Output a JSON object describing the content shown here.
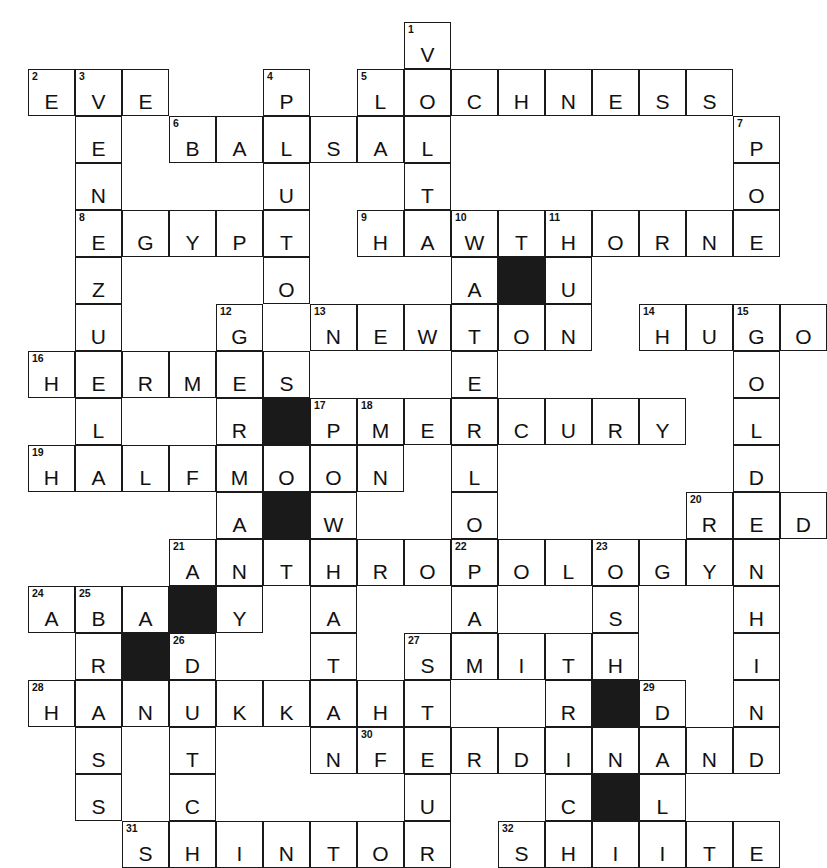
{
  "puzzle": {
    "title": "Crossword Puzzle Grid",
    "columns": 17,
    "rows": 16,
    "cell_size": 47,
    "colors": {
      "grid_line": "#1a1a1a",
      "block_fill": "#1a1a1a",
      "cell_fill": "#ffffff",
      "text": "#111111",
      "page_background": "#ffffff"
    }
  },
  "answers": {
    "across": [
      {
        "number": 2,
        "text": "EVE",
        "row": 1,
        "col": 0
      },
      {
        "number": 5,
        "text": "LOCHNESS",
        "row": 1,
        "col": 7
      },
      {
        "number": 6,
        "text": "BALSA",
        "row": 2,
        "col": 3
      },
      {
        "number": 8,
        "text": "EGYPT",
        "row": 4,
        "col": 1
      },
      {
        "number": 9,
        "text": "HAWTHORNE",
        "row": 4,
        "col": 7
      },
      {
        "number": 13,
        "text": "NEWTON",
        "row": 6,
        "col": 6
      },
      {
        "number": 14,
        "text": "HUGO",
        "row": 6,
        "col": 13
      },
      {
        "number": 16,
        "text": "HERMES",
        "row": 7,
        "col": 0
      },
      {
        "number": 18,
        "text": "MERCURY",
        "row": 8,
        "col": 7
      },
      {
        "number": 19,
        "text": "HALFMOON",
        "row": 9,
        "col": 0
      },
      {
        "number": 20,
        "text": "RED",
        "row": 10,
        "col": 14
      },
      {
        "number": 21,
        "text": "ANTHROPOLOGY",
        "row": 11,
        "col": 3
      },
      {
        "number": 24,
        "text": "ABA",
        "row": 12,
        "col": 0
      },
      {
        "number": 27,
        "text": "SMITH",
        "row": 13,
        "col": 8
      },
      {
        "number": 28,
        "text": "HANUKKAH",
        "row": 14,
        "col": 0
      },
      {
        "number": 30,
        "text": "FERDINAND",
        "row": 15,
        "col": 7
      },
      {
        "number": 31,
        "text": "SHINTO",
        "row": 17,
        "col": 2
      },
      {
        "number": 32,
        "text": "SHIITE",
        "row": 17,
        "col": 10
      }
    ],
    "down": [
      {
        "number": 1,
        "text": "VOLTA",
        "row": 0,
        "col": 8
      },
      {
        "number": 3,
        "text": "EVENZULH",
        "row": 1,
        "col": 1
      },
      {
        "number": 4,
        "text": "PLUTO",
        "row": 1,
        "col": 5
      },
      {
        "number": 7,
        "text": "POE",
        "row": 2,
        "col": 15
      },
      {
        "number": 10,
        "text": "WATERLOO",
        "row": 4,
        "col": 9
      },
      {
        "number": 11,
        "text": "TU",
        "row": 4,
        "col": 11
      },
      {
        "number": 12,
        "text": "GERMANY",
        "row": 6,
        "col": 6
      },
      {
        "number": 15,
        "text": "GOLDEN",
        "row": 6,
        "col": 15
      },
      {
        "number": 17,
        "text": "POW",
        "row": 8,
        "col": 7
      },
      {
        "number": 22,
        "text": "PASTEUR",
        "row": 11,
        "col": 10
      },
      {
        "number": 23,
        "text": "OSH",
        "row": 11,
        "col": 13
      },
      {
        "number": 25,
        "text": "BRASS",
        "row": 12,
        "col": 1
      },
      {
        "number": 26,
        "text": "DNTC",
        "row": 13,
        "col": 3
      },
      {
        "number": 29,
        "text": "DNL",
        "row": 14,
        "col": 13
      }
    ]
  },
  "cells": [
    {
      "r": 0,
      "c": 8,
      "n": "1",
      "l": "V"
    },
    {
      "r": 1,
      "c": 0,
      "n": "2",
      "l": "E"
    },
    {
      "r": 1,
      "c": 1,
      "n": "3",
      "l": "V"
    },
    {
      "r": 1,
      "c": 2,
      "n": "",
      "l": "E"
    },
    {
      "r": 1,
      "c": 5,
      "n": "4",
      "l": "P"
    },
    {
      "r": 1,
      "c": 7,
      "n": "5",
      "l": "L"
    },
    {
      "r": 1,
      "c": 8,
      "n": "",
      "l": "O"
    },
    {
      "r": 1,
      "c": 9,
      "n": "",
      "l": "C"
    },
    {
      "r": 1,
      "c": 10,
      "n": "",
      "l": "H"
    },
    {
      "r": 1,
      "c": 11,
      "n": "",
      "l": "N"
    },
    {
      "r": 1,
      "c": 12,
      "n": "",
      "l": "E"
    },
    {
      "r": 1,
      "c": 13,
      "n": "",
      "l": "S"
    },
    {
      "r": 1,
      "c": 14,
      "n": "",
      "l": "S"
    },
    {
      "r": 2,
      "c": 1,
      "n": "",
      "l": "E"
    },
    {
      "r": 2,
      "c": 3,
      "n": "6",
      "l": "B"
    },
    {
      "r": 2,
      "c": 4,
      "n": "",
      "l": "A"
    },
    {
      "r": 2,
      "c": 5,
      "n": "",
      "l": "L"
    },
    {
      "r": 2,
      "c": 6,
      "n": "",
      "l": "S"
    },
    {
      "r": 2,
      "c": 7,
      "n": "",
      "l": "A"
    },
    {
      "r": 2,
      "c": 8,
      "n": "",
      "l": "L"
    },
    {
      "r": 2,
      "c": 15,
      "n": "7",
      "l": "P"
    },
    {
      "r": 3,
      "c": 1,
      "n": "",
      "l": "N"
    },
    {
      "r": 3,
      "c": 5,
      "n": "",
      "l": "U"
    },
    {
      "r": 3,
      "c": 8,
      "n": "",
      "l": "T"
    },
    {
      "r": 3,
      "c": 15,
      "n": "",
      "l": "O"
    },
    {
      "r": 4,
      "c": 1,
      "n": "8",
      "l": "E"
    },
    {
      "r": 4,
      "c": 2,
      "n": "",
      "l": "G"
    },
    {
      "r": 4,
      "c": 3,
      "n": "",
      "l": "Y"
    },
    {
      "r": 4,
      "c": 4,
      "n": "",
      "l": "P"
    },
    {
      "r": 4,
      "c": 5,
      "n": "",
      "l": "T"
    },
    {
      "r": 4,
      "c": 7,
      "n": "9",
      "l": "H"
    },
    {
      "r": 4,
      "c": 8,
      "n": "",
      "l": "A"
    },
    {
      "r": 4,
      "c": 9,
      "n": "10",
      "l": "W"
    },
    {
      "r": 4,
      "c": 10,
      "n": "",
      "l": "T"
    },
    {
      "r": 4,
      "c": 11,
      "n": "11",
      "l": "H"
    },
    {
      "r": 4,
      "c": 12,
      "n": "",
      "l": "O"
    },
    {
      "r": 4,
      "c": 13,
      "n": "",
      "l": "R"
    },
    {
      "r": 4,
      "c": 14,
      "n": "",
      "l": "N"
    },
    {
      "r": 4,
      "c": 15,
      "n": "",
      "l": "E"
    },
    {
      "r": 5,
      "c": 1,
      "n": "",
      "l": "Z"
    },
    {
      "r": 5,
      "c": 5,
      "n": "",
      "l": "O"
    },
    {
      "r": 5,
      "c": 9,
      "n": "",
      "l": "A"
    },
    {
      "r": 5,
      "c": 10,
      "n": "",
      "l": "",
      "block": true
    },
    {
      "r": 5,
      "c": 11,
      "n": "",
      "l": "U"
    },
    {
      "r": 6,
      "c": 1,
      "n": "",
      "l": "U"
    },
    {
      "r": 6,
      "c": 4,
      "n": "12",
      "l": "G"
    },
    {
      "r": 6,
      "c": 6,
      "n": "13",
      "l": "N"
    },
    {
      "r": 6,
      "c": 7,
      "n": "",
      "l": "E"
    },
    {
      "r": 6,
      "c": 8,
      "n": "",
      "l": "W"
    },
    {
      "r": 6,
      "c": 9,
      "n": "",
      "l": "T"
    },
    {
      "r": 6,
      "c": 10,
      "n": "",
      "l": "O"
    },
    {
      "r": 6,
      "c": 11,
      "n": "",
      "l": "N"
    },
    {
      "r": 6,
      "c": 13,
      "n": "14",
      "l": "H"
    },
    {
      "r": 6,
      "c": 14,
      "n": "",
      "l": "U"
    },
    {
      "r": 6,
      "c": 15,
      "n": "15",
      "l": "G"
    },
    {
      "r": 6,
      "c": 16,
      "n": "",
      "l": "O"
    },
    {
      "r": 7,
      "c": 0,
      "n": "16",
      "l": "H"
    },
    {
      "r": 7,
      "c": 1,
      "n": "",
      "l": "E"
    },
    {
      "r": 7,
      "c": 2,
      "n": "",
      "l": "R"
    },
    {
      "r": 7,
      "c": 3,
      "n": "",
      "l": "M"
    },
    {
      "r": 7,
      "c": 4,
      "n": "",
      "l": "E"
    },
    {
      "r": 7,
      "c": 5,
      "n": "",
      "l": "S"
    },
    {
      "r": 7,
      "c": 9,
      "n": "",
      "l": "E"
    },
    {
      "r": 7,
      "c": 15,
      "n": "",
      "l": "O"
    },
    {
      "r": 8,
      "c": 1,
      "n": "",
      "l": "L"
    },
    {
      "r": 8,
      "c": 4,
      "n": "",
      "l": "R"
    },
    {
      "r": 8,
      "c": 5,
      "n": "",
      "l": "",
      "block": true
    },
    {
      "r": 8,
      "c": 6,
      "n": "17",
      "l": "P"
    },
    {
      "r": 8,
      "c": 7,
      "n": "18",
      "l": "M"
    },
    {
      "r": 8,
      "c": 8,
      "n": "",
      "l": "E"
    },
    {
      "r": 8,
      "c": 9,
      "n": "",
      "l": "R"
    },
    {
      "r": 8,
      "c": 10,
      "n": "",
      "l": "C"
    },
    {
      "r": 8,
      "c": 11,
      "n": "",
      "l": "U"
    },
    {
      "r": 8,
      "c": 12,
      "n": "",
      "l": "R"
    },
    {
      "r": 8,
      "c": 13,
      "n": "",
      "l": "Y"
    },
    {
      "r": 8,
      "c": 15,
      "n": "",
      "l": "L"
    },
    {
      "r": 9,
      "c": 0,
      "n": "19",
      "l": "H"
    },
    {
      "r": 9,
      "c": 1,
      "n": "",
      "l": "A"
    },
    {
      "r": 9,
      "c": 2,
      "n": "",
      "l": "L"
    },
    {
      "r": 9,
      "c": 3,
      "n": "",
      "l": "F"
    },
    {
      "r": 9,
      "c": 4,
      "n": "",
      "l": "M"
    },
    {
      "r": 9,
      "c": 5,
      "n": "",
      "l": "O"
    },
    {
      "r": 9,
      "c": 6,
      "n": "",
      "l": "O"
    },
    {
      "r": 9,
      "c": 7,
      "n": "",
      "l": "N"
    },
    {
      "r": 9,
      "c": 9,
      "n": "",
      "l": "L"
    },
    {
      "r": 9,
      "c": 15,
      "n": "",
      "l": "D"
    },
    {
      "r": 10,
      "c": 4,
      "n": "",
      "l": "A"
    },
    {
      "r": 10,
      "c": 5,
      "n": "",
      "l": "",
      "block": true
    },
    {
      "r": 10,
      "c": 6,
      "n": "",
      "l": "W"
    },
    {
      "r": 10,
      "c": 9,
      "n": "",
      "l": "O"
    },
    {
      "r": 10,
      "c": 14,
      "n": "20",
      "l": "R"
    },
    {
      "r": 10,
      "c": 15,
      "n": "",
      "l": "E"
    },
    {
      "r": 10,
      "c": 16,
      "n": "",
      "l": "D"
    },
    {
      "r": 11,
      "c": 3,
      "n": "21",
      "l": "A"
    },
    {
      "r": 11,
      "c": 4,
      "n": "",
      "l": "N"
    },
    {
      "r": 11,
      "c": 5,
      "n": "",
      "l": "T"
    },
    {
      "r": 11,
      "c": 6,
      "n": "",
      "l": "H"
    },
    {
      "r": 11,
      "c": 7,
      "n": "",
      "l": "R"
    },
    {
      "r": 11,
      "c": 8,
      "n": "",
      "l": "O"
    },
    {
      "r": 11,
      "c": 9,
      "n": "22",
      "l": "P"
    },
    {
      "r": 11,
      "c": 10,
      "n": "",
      "l": "O"
    },
    {
      "r": 11,
      "c": 11,
      "n": "",
      "l": "L"
    },
    {
      "r": 11,
      "c": 12,
      "n": "23",
      "l": "O"
    },
    {
      "r": 11,
      "c": 13,
      "n": "",
      "l": "G"
    },
    {
      "r": 11,
      "c": 14,
      "n": "",
      "l": "Y"
    },
    {
      "r": 11,
      "c": 15,
      "n": "",
      "l": "N"
    },
    {
      "r": 12,
      "c": 0,
      "n": "24",
      "l": "A"
    },
    {
      "r": 12,
      "c": 1,
      "n": "25",
      "l": "B"
    },
    {
      "r": 12,
      "c": 2,
      "n": "",
      "l": "A"
    },
    {
      "r": 12,
      "c": 3,
      "n": "",
      "l": "",
      "block": true
    },
    {
      "r": 12,
      "c": 4,
      "n": "",
      "l": "Y"
    },
    {
      "r": 12,
      "c": 6,
      "n": "",
      "l": "A"
    },
    {
      "r": 12,
      "c": 9,
      "n": "",
      "l": "A"
    },
    {
      "r": 12,
      "c": 12,
      "n": "",
      "l": "S"
    },
    {
      "r": 12,
      "c": 15,
      "n": "",
      "l": "H"
    },
    {
      "r": 13,
      "c": 1,
      "n": "",
      "l": "R"
    },
    {
      "r": 13,
      "c": 2,
      "n": "",
      "l": "",
      "block": true
    },
    {
      "r": 13,
      "c": 3,
      "n": "26",
      "l": "D"
    },
    {
      "r": 13,
      "c": 6,
      "n": "",
      "l": "T"
    },
    {
      "r": 13,
      "c": 8,
      "n": "27",
      "l": "S"
    },
    {
      "r": 13,
      "c": 9,
      "n": "",
      "l": "M"
    },
    {
      "r": 13,
      "c": 10,
      "n": "",
      "l": "I"
    },
    {
      "r": 13,
      "c": 11,
      "n": "",
      "l": "T"
    },
    {
      "r": 13,
      "c": 12,
      "n": "",
      "l": "H"
    },
    {
      "r": 13,
      "c": 15,
      "n": "",
      "l": "I"
    },
    {
      "r": 14,
      "c": 0,
      "n": "28",
      "l": "H"
    },
    {
      "r": 14,
      "c": 1,
      "n": "",
      "l": "A"
    },
    {
      "r": 14,
      "c": 2,
      "n": "",
      "l": "N"
    },
    {
      "r": 14,
      "c": 3,
      "n": "",
      "l": "U"
    },
    {
      "r": 14,
      "c": 4,
      "n": "",
      "l": "K"
    },
    {
      "r": 14,
      "c": 5,
      "n": "",
      "l": "K"
    },
    {
      "r": 14,
      "c": 6,
      "n": "",
      "l": "A"
    },
    {
      "r": 14,
      "c": 7,
      "n": "",
      "l": "H"
    },
    {
      "r": 14,
      "c": 8,
      "n": "",
      "l": "T"
    },
    {
      "r": 14,
      "c": 11,
      "n": "",
      "l": "R"
    },
    {
      "r": 14,
      "c": 12,
      "n": "",
      "l": "",
      "block": true
    },
    {
      "r": 14,
      "c": 13,
      "n": "29",
      "l": "D"
    },
    {
      "r": 14,
      "c": 15,
      "n": "",
      "l": "N"
    },
    {
      "r": 15,
      "c": 1,
      "n": "",
      "l": "S"
    },
    {
      "r": 15,
      "c": 3,
      "n": "",
      "l": "T"
    },
    {
      "r": 15,
      "c": 6,
      "n": "",
      "l": "N"
    },
    {
      "r": 15,
      "c": 7,
      "n": "30",
      "l": "F"
    },
    {
      "r": 15,
      "c": 8,
      "n": "",
      "l": "E"
    },
    {
      "r": 15,
      "c": 9,
      "n": "",
      "l": "R"
    },
    {
      "r": 15,
      "c": 10,
      "n": "",
      "l": "D"
    },
    {
      "r": 15,
      "c": 11,
      "n": "",
      "l": "I"
    },
    {
      "r": 15,
      "c": 12,
      "n": "",
      "l": "N"
    },
    {
      "r": 15,
      "c": 13,
      "n": "",
      "l": "A"
    },
    {
      "r": 15,
      "c": 14,
      "n": "",
      "l": "N"
    },
    {
      "r": 15,
      "c": 15,
      "n": "",
      "l": "D"
    },
    {
      "r": 16,
      "c": 1,
      "n": "",
      "l": "S"
    },
    {
      "r": 16,
      "c": 3,
      "n": "",
      "l": "C"
    },
    {
      "r": 16,
      "c": 8,
      "n": "",
      "l": "U"
    },
    {
      "r": 16,
      "c": 11,
      "n": "",
      "l": "C"
    },
    {
      "r": 16,
      "c": 12,
      "n": "",
      "l": "",
      "block": true
    },
    {
      "r": 16,
      "c": 13,
      "n": "",
      "l": "L"
    },
    {
      "r": 17,
      "c": 2,
      "n": "31",
      "l": "S"
    },
    {
      "r": 17,
      "c": 3,
      "n": "",
      "l": "H"
    },
    {
      "r": 17,
      "c": 4,
      "n": "",
      "l": "I"
    },
    {
      "r": 17,
      "c": 5,
      "n": "",
      "l": "N"
    },
    {
      "r": 17,
      "c": 6,
      "n": "",
      "l": "T"
    },
    {
      "r": 17,
      "c": 7,
      "n": "",
      "l": "O"
    },
    {
      "r": 17,
      "c": 8,
      "n": "",
      "l": "R"
    },
    {
      "r": 17,
      "c": 10,
      "n": "32",
      "l": "S"
    },
    {
      "r": 17,
      "c": 11,
      "n": "",
      "l": "H"
    },
    {
      "r": 17,
      "c": 12,
      "n": "",
      "l": "I"
    },
    {
      "r": 17,
      "c": 13,
      "n": "",
      "l": "I"
    },
    {
      "r": 17,
      "c": 14,
      "n": "",
      "l": "T"
    },
    {
      "r": 17,
      "c": 15,
      "n": "",
      "l": "E"
    }
  ]
}
